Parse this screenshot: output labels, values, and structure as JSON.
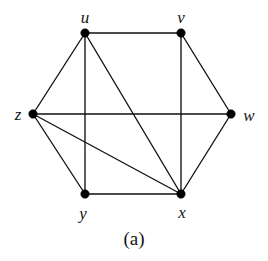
{
  "figure": {
    "caption": "(a)",
    "background_color": "#ffffff",
    "edge_color": "#111111",
    "vertex_color": "#000000",
    "label_color": "#141414",
    "width": 268,
    "height": 261
  },
  "chart_data": {
    "type": "diagram",
    "diagram_kind": "undirected-graph",
    "title": "(a)",
    "vertex_count": 6,
    "edge_count": 11,
    "vertices": [
      {
        "id": "u",
        "label": "u",
        "x": 85,
        "y": 33,
        "label_x": 85,
        "label_y": 17,
        "degree": 4
      },
      {
        "id": "v",
        "label": "v",
        "x": 181,
        "y": 33,
        "label_x": 181,
        "label_y": 17,
        "degree": 3
      },
      {
        "id": "w",
        "label": "w",
        "x": 231,
        "y": 114,
        "label_x": 249,
        "label_y": 115,
        "degree": 3
      },
      {
        "id": "x",
        "label": "x",
        "x": 181,
        "y": 194,
        "label_x": 182,
        "label_y": 212,
        "degree": 5
      },
      {
        "id": "y",
        "label": "y",
        "x": 85,
        "y": 194,
        "label_x": 83,
        "label_y": 213,
        "degree": 3
      },
      {
        "id": "z",
        "label": "z",
        "x": 33,
        "y": 114,
        "label_x": 18,
        "label_y": 114,
        "degree": 4
      }
    ],
    "edges": [
      {
        "from": "u",
        "to": "v",
        "kind": "hull"
      },
      {
        "from": "v",
        "to": "w",
        "kind": "hull"
      },
      {
        "from": "w",
        "to": "x",
        "kind": "hull"
      },
      {
        "from": "x",
        "to": "y",
        "kind": "hull"
      },
      {
        "from": "y",
        "to": "z",
        "kind": "hull"
      },
      {
        "from": "z",
        "to": "u",
        "kind": "hull"
      },
      {
        "from": "u",
        "to": "y",
        "kind": "chord"
      },
      {
        "from": "u",
        "to": "x",
        "kind": "chord"
      },
      {
        "from": "v",
        "to": "x",
        "kind": "chord"
      },
      {
        "from": "z",
        "to": "w",
        "kind": "chord"
      },
      {
        "from": "z",
        "to": "x",
        "kind": "chord"
      }
    ],
    "adjacency": {
      "u": [
        "v",
        "z",
        "y",
        "x"
      ],
      "v": [
        "u",
        "w",
        "x"
      ],
      "w": [
        "v",
        "z",
        "x"
      ],
      "x": [
        "w",
        "y",
        "u",
        "v",
        "z"
      ],
      "y": [
        "x",
        "z",
        "u"
      ],
      "z": [
        "y",
        "u",
        "w",
        "x"
      ]
    },
    "xlabel": "",
    "ylabel": "",
    "grid": false,
    "legend": false
  }
}
